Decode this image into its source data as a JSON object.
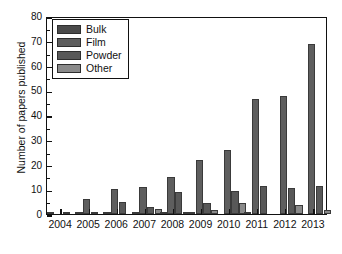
{
  "chart_data": {
    "type": "bar",
    "title": "",
    "xlabel": "",
    "ylabel": "Number of papers published",
    "ylim": [
      0,
      80
    ],
    "ytick_step": 10,
    "yticks": [
      0,
      10,
      20,
      30,
      40,
      50,
      60,
      70,
      80
    ],
    "ytick_labels": [
      "0",
      "10",
      "20",
      "30",
      "40",
      "50",
      "60",
      "70",
      "80"
    ],
    "grid": false,
    "legend_position": "upper-left",
    "categories": [
      "2004",
      "2005",
      "2006",
      "2007",
      "2008",
      "2009",
      "2010",
      "2011",
      "2012",
      "2013"
    ],
    "series": [
      {
        "name": "Bulk",
        "color": "#4a4a4a",
        "values": [
          1,
          1,
          1,
          1,
          1,
          1,
          0,
          1,
          0,
          0
        ]
      },
      {
        "name": "Film",
        "color": "#5e5e5e",
        "values": [
          0,
          6,
          10,
          11,
          15,
          22,
          26,
          46.5,
          47.5,
          68.5
        ]
      },
      {
        "name": "Powder",
        "color": "#585858",
        "values": [
          1,
          1,
          5,
          3,
          9,
          4.5,
          9.5,
          11.5,
          10.5,
          11.5
        ]
      },
      {
        "name": "Other",
        "color": "#8a8a8a",
        "values": [
          0,
          0,
          0,
          2,
          1,
          1.5,
          4.5,
          0,
          3.5,
          1.5
        ]
      }
    ]
  },
  "legend": {
    "items": [
      {
        "label": "Bulk",
        "color": "#4a4a4a"
      },
      {
        "label": "Film",
        "color": "#5e5e5e"
      },
      {
        "label": "Powder",
        "color": "#585858"
      },
      {
        "label": "Other",
        "color": "#8a8a8a"
      }
    ]
  },
  "axes": {
    "y_title": "Number of papers published",
    "frame_color": "#111111"
  }
}
